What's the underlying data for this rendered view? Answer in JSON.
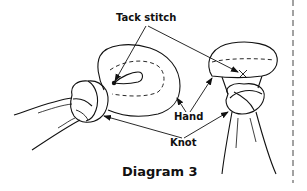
{
  "labels": {
    "tack_stitch": "Tack stitch",
    "hand": "Hand",
    "knot": "Knot"
  },
  "caption": "Diagram 3",
  "colors": {
    "stroke": "#111111",
    "background": "#ffffff"
  },
  "figures": [
    {
      "name": "left-puppet-hand",
      "description": "side view, hand folded into a loop with tack stitch, knot at wrist"
    },
    {
      "name": "right-puppet-hand",
      "description": "front view, folded head with tack stitch marked X, knot below"
    }
  ]
}
